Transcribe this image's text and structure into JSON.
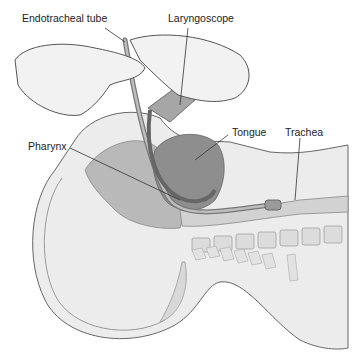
{
  "figure": {
    "labels": {
      "endotracheal_tube": "Endotracheal tube",
      "laryngoscope": "Laryngoscope",
      "tongue": "Tongue",
      "trachea": "Trachea",
      "pharynx": "Pharynx"
    }
  },
  "colors": {
    "background": "#ffffff",
    "body_fill": "#ececec",
    "skin_line": "#666666",
    "tissue_gray": "#b9b9b9",
    "tongue_fill": "#8e8e8e",
    "airway_fill": "#a8a8a8",
    "glove_fill": "#f2f2f2",
    "tube_fill": "#9a9a9a",
    "bone_fill": "#dcdcdc"
  }
}
